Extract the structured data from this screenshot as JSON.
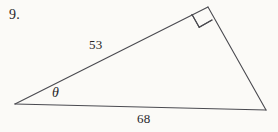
{
  "figure": {
    "problem_number": "9.",
    "background_color": "#fbfaf7",
    "stroke_color": "#4a4a50",
    "text_color": "#26262a",
    "shape": "right-triangle",
    "vertices": {
      "left": {
        "x": 15,
        "y": 104
      },
      "apex": {
        "x": 208,
        "y": 7
      },
      "right": {
        "x": 266,
        "y": 110
      }
    },
    "sides": [
      {
        "name": "left-side",
        "label": "53",
        "from": "left",
        "to": "apex",
        "label_x": 89,
        "label_y": 38
      },
      {
        "name": "base-side",
        "label": "68",
        "from": "left",
        "to": "right",
        "label_x": 137,
        "label_y": 112
      },
      {
        "name": "right-side",
        "label": "",
        "from": "apex",
        "to": "right"
      }
    ],
    "angles": [
      {
        "name": "theta-angle",
        "label": "θ",
        "at": "left",
        "label_x": 52,
        "label_y": 86
      },
      {
        "name": "right-angle",
        "label": "",
        "at": "apex",
        "marker": "square"
      }
    ]
  }
}
